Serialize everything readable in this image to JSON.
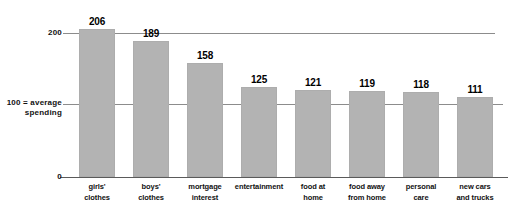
{
  "chart_data": {
    "type": "bar",
    "title": "",
    "subtitle": "",
    "xlabel": "",
    "ylabel": "",
    "categories": [
      "girls' clothes",
      "boys' clothes",
      "mortgage interest",
      "entertainment",
      "food at home",
      "food away from home",
      "personal care",
      "new cars and trucks"
    ],
    "category_lines": [
      [
        "girls'",
        "clothes"
      ],
      [
        "boys'",
        "clothes"
      ],
      [
        "mortgage",
        "interest"
      ],
      [
        "entertainment"
      ],
      [
        "food at",
        "home"
      ],
      [
        "food away",
        "from home"
      ],
      [
        "personal",
        "care"
      ],
      [
        "new cars",
        "and trucks"
      ]
    ],
    "values": [
      206,
      189,
      158,
      125,
      121,
      119,
      118,
      111
    ],
    "ylim": [
      0,
      215
    ],
    "yticks": [
      0,
      100,
      200
    ],
    "ytick_labels": [
      "0",
      "100 = average spending",
      "200"
    ],
    "gridlines": [
      100,
      200
    ],
    "grid": true,
    "legend": "none",
    "bar_color": "#b3b3b3",
    "gridline_color": "#8c8c8c",
    "axis_color": "#5a5a5a",
    "label_color": "#111111"
  },
  "axis": {
    "tick_200": "200",
    "tick_100_line1": "100 = average",
    "tick_100_line2": "spending",
    "tick_0": "0"
  }
}
